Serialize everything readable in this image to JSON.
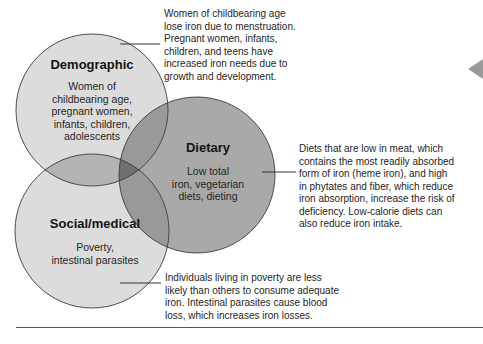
{
  "diagram": {
    "type": "venn",
    "circles": [
      {
        "id": "demographic",
        "title": "Demographic",
        "body_lines": [
          "Women of",
          "childbearing age,",
          "pregnant women,",
          "infants, children,",
          "adolescents"
        ],
        "fill": "#dcdcdc"
      },
      {
        "id": "dietary",
        "title": "Dietary",
        "body_lines": [
          "Low total",
          "iron, vegetarian",
          "diets, dieting"
        ],
        "fill": "#a9a9a9"
      },
      {
        "id": "social_medical",
        "title": "Social/medical",
        "body_lines": [
          "Poverty,",
          "intestinal parasites"
        ],
        "fill": "#dcdcdc"
      }
    ],
    "overlap_colors": {
      "demographic_social": "#b4b4b4",
      "demographic_dietary": "#999999",
      "dietary_social": "#999999",
      "all_three": "#6f6f6f"
    },
    "stroke_color": "#3c3c3c"
  },
  "callouts": {
    "demographic": [
      "Women of childbearing age",
      "lose iron due to menstruation.",
      "Pregnant women, infants,",
      "children, and teens have",
      "increased iron needs due to",
      "growth and development."
    ],
    "dietary": [
      "Diets that are low in meat, which",
      "contains the most readily absorbed",
      "form of iron (heme iron), and high",
      "in phytates and fiber, which reduce",
      "iron absorption, increase the risk of",
      "deficiency. Low-calorie diets can",
      "also reduce iron intake."
    ],
    "social_medical": [
      "Individuals living in poverty are less",
      "likely than others to consume adequate",
      "iron. Intestinal parasites cause blood",
      "loss, which increases iron losses."
    ]
  },
  "nav": {
    "arrow": "left-arrow-icon",
    "arrow_color": "#9a9a9a"
  }
}
